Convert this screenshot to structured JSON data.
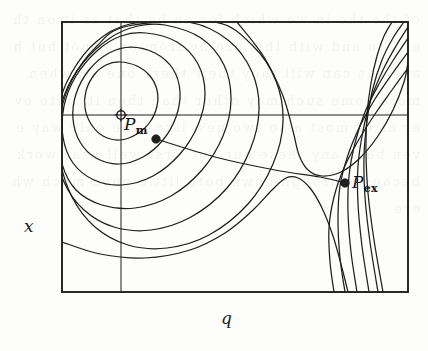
{
  "figure": {
    "kind": "contour-plot",
    "background_color": "#fdfdfc",
    "line_color": "#1f1f1f",
    "ghost_text": "of the the in we which for an be that as it on the is to and with this are by from or at not but have has can will they their there one all when more some such may other than then its into over after most also two new like time only way even back any these our out first well year work because through down both little good much where"
  },
  "axes": {
    "x_label": "x",
    "y_label": "q",
    "frame": {
      "left": 62,
      "top": 22,
      "right": 408,
      "bottom": 292
    },
    "gridlines": {
      "horizontal_y": 115,
      "vertical_x": 121
    }
  },
  "points": [
    {
      "id": "pm",
      "label_base": "P",
      "label_sub": "m",
      "marker": "open-circle-crosshair",
      "x": 121,
      "y": 115
    },
    {
      "id": "pm-dot",
      "label_base": "",
      "label_sub": "",
      "marker": "filled-dot",
      "x": 156,
      "y": 139
    },
    {
      "id": "pex",
      "label_base": "P",
      "label_sub": "ex",
      "marker": "filled-dot",
      "x": 345,
      "y": 183
    }
  ],
  "chart_data": {
    "type": "line",
    "title": "",
    "xlabel": "q",
    "ylabel": "x",
    "grid": true,
    "legend": false,
    "xlim": [
      62,
      408
    ],
    "ylim": [
      292,
      22
    ],
    "annotations": [
      {
        "text": "P_m",
        "x": 121,
        "y": 115,
        "note": "metastable minimum marked with open crosshair circle"
      },
      {
        "text": "P_ex",
        "x": 345,
        "y": 183,
        "note": "exit point marked with filled dot"
      }
    ],
    "series": [
      {
        "name": "connector",
        "kind": "path",
        "points": [
          [
            156,
            139
          ],
          [
            215,
            157
          ],
          [
            275,
            170
          ],
          [
            320,
            177
          ],
          [
            345,
            183
          ]
        ]
      },
      {
        "name": "closed-contour-1",
        "kind": "closed",
        "points": [
          [
            120,
            62
          ],
          [
            137,
            66
          ],
          [
            150,
            76
          ],
          [
            157,
            90
          ],
          [
            157,
            106
          ],
          [
            150,
            122
          ],
          [
            137,
            134
          ],
          [
            120,
            140
          ],
          [
            103,
            136
          ],
          [
            91,
            124
          ],
          [
            85,
            108
          ],
          [
            86,
            91
          ],
          [
            94,
            75
          ],
          [
            106,
            65
          ]
        ]
      },
      {
        "name": "closed-contour-2",
        "kind": "closed",
        "points": [
          [
            131,
            47
          ],
          [
            155,
            53
          ],
          [
            173,
            69
          ],
          [
            180,
            92
          ],
          [
            176,
            117
          ],
          [
            163,
            140
          ],
          [
            143,
            157
          ],
          [
            119,
            164
          ],
          [
            96,
            158
          ],
          [
            80,
            142
          ],
          [
            73,
            119
          ],
          [
            76,
            94
          ],
          [
            89,
            70
          ],
          [
            109,
            53
          ]
        ]
      },
      {
        "name": "closed-contour-3",
        "kind": "closed",
        "points": [
          [
            146,
            33
          ],
          [
            177,
            42
          ],
          [
            198,
            64
          ],
          [
            205,
            94
          ],
          [
            198,
            125
          ],
          [
            180,
            154
          ],
          [
            153,
            176
          ],
          [
            122,
            185
          ],
          [
            94,
            180
          ],
          [
            73,
            163
          ],
          [
            63,
            137
          ],
          [
            64,
            106
          ],
          [
            76,
            76
          ],
          [
            98,
            50
          ],
          [
            121,
            36
          ]
        ]
      },
      {
        "name": "closed-contour-4",
        "kind": "closed",
        "points": [
          [
            165,
            25
          ],
          [
            201,
            38
          ],
          [
            224,
            65
          ],
          [
            231,
            100
          ],
          [
            223,
            136
          ],
          [
            202,
            170
          ],
          [
            171,
            196
          ],
          [
            135,
            208
          ],
          [
            102,
            205
          ],
          [
            76,
            190
          ],
          [
            62,
            164
          ],
          [
            58,
            130
          ],
          [
            64,
            96
          ],
          [
            82,
            64
          ],
          [
            110,
            38
          ],
          [
            138,
            26
          ]
        ]
      },
      {
        "name": "closed-contour-5",
        "kind": "closed",
        "points": [
          [
            188,
            22
          ],
          [
            228,
            40
          ],
          [
            252,
            72
          ],
          [
            259,
            110
          ],
          [
            250,
            150
          ],
          [
            227,
            188
          ],
          [
            191,
            217
          ],
          [
            151,
            230
          ],
          [
            114,
            227
          ],
          [
            84,
            210
          ],
          [
            64,
            182
          ],
          [
            56,
            146
          ],
          [
            58,
            108
          ],
          [
            72,
            72
          ],
          [
            96,
            42
          ],
          [
            130,
            24
          ]
        ]
      },
      {
        "name": "closed-contour-6",
        "kind": "closed",
        "points": [
          [
            214,
            22
          ],
          [
            253,
            46
          ],
          [
            276,
            81
          ],
          [
            283,
            122
          ],
          [
            273,
            164
          ],
          [
            248,
            204
          ],
          [
            209,
            235
          ],
          [
            167,
            248
          ],
          [
            128,
            245
          ],
          [
            95,
            227
          ],
          [
            72,
            197
          ],
          [
            60,
            159
          ],
          [
            60,
            117
          ],
          [
            72,
            80
          ],
          [
            96,
            47
          ],
          [
            128,
            26
          ]
        ]
      },
      {
        "name": "separatrix-upper",
        "kind": "open",
        "points": [
          [
            237,
            22
          ],
          [
            264,
            57
          ],
          [
            283,
            96
          ],
          [
            293,
            131
          ],
          [
            299,
            155
          ],
          [
            308,
            170
          ],
          [
            322,
            176
          ],
          [
            341,
            172
          ],
          [
            360,
            158
          ],
          [
            378,
            136
          ],
          [
            393,
            110
          ],
          [
            404,
            82
          ],
          [
            408,
            62
          ]
        ]
      },
      {
        "name": "separatrix-lower",
        "kind": "open",
        "points": [
          [
            62,
            242
          ],
          [
            100,
            254
          ],
          [
            145,
            258
          ],
          [
            190,
            250
          ],
          [
            225,
            233
          ],
          [
            252,
            211
          ],
          [
            272,
            190
          ],
          [
            286,
            178
          ],
          [
            298,
            178
          ],
          [
            310,
            188
          ],
          [
            322,
            208
          ],
          [
            333,
            236
          ],
          [
            342,
            268
          ],
          [
            348,
            292
          ]
        ]
      },
      {
        "name": "right-branch-1",
        "kind": "open",
        "points": [
          [
            408,
            68
          ],
          [
            392,
            90
          ],
          [
            375,
            114
          ],
          [
            358,
            141
          ],
          [
            344,
            168
          ],
          [
            334,
            197
          ],
          [
            329,
            228
          ],
          [
            330,
            262
          ],
          [
            334,
            292
          ]
        ]
      },
      {
        "name": "right-branch-2",
        "kind": "open",
        "points": [
          [
            408,
            52
          ],
          [
            392,
            74
          ],
          [
            375,
            99
          ],
          [
            360,
            126
          ],
          [
            348,
            155
          ],
          [
            340,
            186
          ],
          [
            338,
            220
          ],
          [
            340,
            258
          ],
          [
            345,
            292
          ]
        ]
      },
      {
        "name": "right-branch-3",
        "kind": "open",
        "points": [
          [
            408,
            38
          ],
          [
            394,
            59
          ],
          [
            379,
            84
          ],
          [
            365,
            112
          ],
          [
            355,
            143
          ],
          [
            349,
            176
          ],
          [
            348,
            212
          ],
          [
            351,
            252
          ],
          [
            357,
            292
          ]
        ]
      },
      {
        "name": "right-branch-4",
        "kind": "open",
        "points": [
          [
            408,
            27
          ],
          [
            396,
            46
          ],
          [
            383,
            70
          ],
          [
            371,
            99
          ],
          [
            363,
            131
          ],
          [
            358,
            166
          ],
          [
            358,
            204
          ],
          [
            362,
            246
          ],
          [
            369,
            292
          ]
        ]
      },
      {
        "name": "right-branch-5",
        "kind": "open",
        "points": [
          [
            404,
            22
          ],
          [
            393,
            38
          ],
          [
            382,
            60
          ],
          [
            373,
            88
          ],
          [
            367,
            121
          ],
          [
            364,
            157
          ],
          [
            365,
            197
          ],
          [
            370,
            242
          ],
          [
            378,
            292
          ]
        ]
      },
      {
        "name": "right-branch-6",
        "kind": "open",
        "points": [
          [
            392,
            22
          ],
          [
            384,
            36
          ],
          [
            377,
            56
          ],
          [
            371,
            83
          ],
          [
            367,
            115
          ],
          [
            366,
            152
          ],
          [
            368,
            193
          ],
          [
            374,
            240
          ],
          [
            383,
            292
          ]
        ]
      }
    ]
  }
}
